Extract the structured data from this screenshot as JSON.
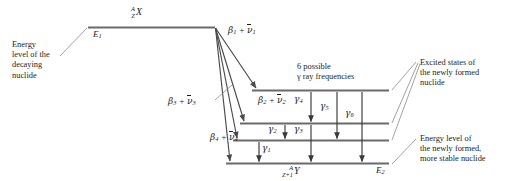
{
  "figure": {
    "type": "nuclear-decay-energy-level-diagram",
    "background": "#ffffff",
    "line_color": "#5a5a5a",
    "text_color": "#1d1d1d"
  },
  "annotations": {
    "left_caption": "Energy\nlevel of the\ndecaying\nnuclide",
    "gamma_caption": "6 possible\nγ ray frequencies",
    "excited_caption": "Excited states of\nthe newly formed\nnuclide",
    "final_caption": "Energy level of\nthe newly formed,\nmore stable nuclide"
  },
  "levels": {
    "parent": {
      "energy_label": "E",
      "energy_sub": "1",
      "nuclide_pre_top": "A",
      "nuclide_pre_bottom": "Z",
      "nuclide_symbol": "X"
    },
    "daughter_ground": {
      "energy_label": "E",
      "energy_sub": "2",
      "nuclide_pre_top": "A",
      "nuclide_pre_bottom": "Z+1",
      "nuclide_symbol": "Y"
    },
    "excited_count": 3,
    "total_daughter_levels": 4
  },
  "beta_transitions": [
    {
      "id": "beta-1",
      "greek": "β",
      "sub": "1",
      "plus": "+",
      "anti": "ν",
      "anti_sub": "1"
    },
    {
      "id": "beta-2",
      "greek": "β",
      "sub": "2",
      "plus": "+",
      "anti": "ν",
      "anti_sub": "2"
    },
    {
      "id": "beta-3",
      "greek": "β",
      "sub": "3",
      "plus": "+",
      "anti": "ν",
      "anti_sub": "3"
    },
    {
      "id": "beta-4",
      "greek": "β",
      "sub": "4",
      "plus": "+",
      "anti": "ν",
      "anti_sub": "4"
    }
  ],
  "gamma_transitions": [
    {
      "id": "gamma-1",
      "greek": "γ",
      "sub": "1",
      "from_level": 3,
      "to_level": 4
    },
    {
      "id": "gamma-2",
      "greek": "γ",
      "sub": "2",
      "from_level": 2,
      "to_level": 3
    },
    {
      "id": "gamma-3",
      "greek": "γ",
      "sub": "3",
      "from_level": 2,
      "to_level": 4
    },
    {
      "id": "gamma-4",
      "greek": "γ",
      "sub": "4",
      "from_level": 1,
      "to_level": 2
    },
    {
      "id": "gamma-5",
      "greek": "γ",
      "sub": "5",
      "from_level": 1,
      "to_level": 3
    },
    {
      "id": "gamma-6",
      "greek": "γ",
      "sub": "6",
      "from_level": 1,
      "to_level": 4
    }
  ]
}
